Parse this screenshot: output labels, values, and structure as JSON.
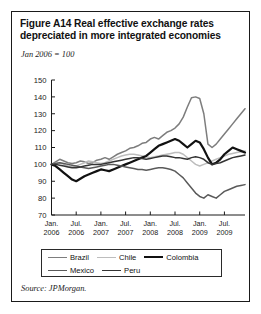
{
  "figure": {
    "title_line_1": "Figure A14  Real effective exchange rates",
    "title_line_2": "depreciated in more integrated economies",
    "index_note": "Jan 2006 = 100",
    "source": "Source: JPMorgan."
  },
  "legend": {
    "rows": [
      [
        {
          "label": "Brazil",
          "color": "#7d7d7d",
          "width": 1.5
        },
        {
          "label": "Chile",
          "color": "#bdbdbd",
          "width": 1.5
        },
        {
          "label": "Colombia",
          "color": "#111111",
          "width": 2.2
        }
      ],
      [
        {
          "label": "Mexico",
          "color": "#5a5a5a",
          "width": 1.5
        },
        {
          "label": "Peru",
          "color": "#343434",
          "width": 1.5
        }
      ]
    ]
  },
  "chart_data": {
    "type": "line",
    "title": "Figure A14  Real effective exchange rates depreciated in more integrated economies",
    "subtitle": "Jan 2006 = 100",
    "xlabel": "",
    "ylabel": "",
    "ylim": [
      70,
      150
    ],
    "yticks": [
      70,
      80,
      90,
      100,
      110,
      120,
      130,
      140,
      150
    ],
    "grid": false,
    "legend_position": "bottom",
    "xlim": [
      0,
      47
    ],
    "xticks": [
      0,
      6,
      12,
      18,
      24,
      30,
      36,
      42
    ],
    "xtick_labels": [
      {
        "month": "Jan.",
        "year": "2006"
      },
      {
        "month": "Jul.",
        "year": "2006"
      },
      {
        "month": "Jan.",
        "year": "2007"
      },
      {
        "month": "Jul.",
        "year": "2007"
      },
      {
        "month": "Jan.",
        "year": "2008"
      },
      {
        "month": "Jul.",
        "year": "2008"
      },
      {
        "month": "Jan.",
        "year": "2009"
      },
      {
        "month": "Jul.",
        "year": "2009"
      }
    ],
    "x": [
      0,
      1,
      2,
      3,
      4,
      5,
      6,
      7,
      8,
      9,
      10,
      11,
      12,
      13,
      14,
      15,
      16,
      17,
      18,
      19,
      20,
      21,
      22,
      23,
      24,
      25,
      26,
      27,
      28,
      29,
      30,
      31,
      32,
      33,
      34,
      35,
      36,
      37,
      38,
      39,
      40,
      41,
      42,
      43,
      44,
      45,
      46,
      47
    ],
    "series": [
      {
        "name": "Brazil",
        "color": "#7d7d7d",
        "width": 1.5,
        "values": [
          100,
          101.5,
          103,
          102,
          101,
          100.5,
          101,
          102,
          101.5,
          100.5,
          101,
          102.5,
          103,
          104,
          103,
          104.5,
          106,
          107,
          108,
          109.5,
          110,
          111,
          112.5,
          113,
          115,
          116,
          115,
          117,
          119,
          120,
          121.5,
          124,
          128,
          134,
          139.5,
          140,
          139,
          130,
          112,
          110,
          112,
          115,
          118,
          121,
          124,
          127,
          130,
          133
        ]
      },
      {
        "name": "Chile",
        "color": "#bdbdbd",
        "width": 1.5,
        "values": [
          100,
          100.5,
          101,
          100,
          99,
          98.5,
          99,
          100,
          101,
          102,
          101.5,
          101,
          100.5,
          101,
          102,
          103,
          104,
          105,
          105.5,
          106,
          106,
          105.5,
          105,
          104.5,
          104,
          104.5,
          105,
          105.5,
          106,
          106.5,
          107,
          107,
          106,
          104,
          102,
          100,
          99,
          100,
          101,
          102,
          103,
          104,
          105,
          106,
          106.5,
          107,
          107.5,
          108
        ]
      },
      {
        "name": "Colombia",
        "color": "#111111",
        "width": 2.2,
        "values": [
          100,
          99,
          97,
          95,
          93,
          91,
          90,
          91.5,
          93,
          94,
          95,
          96,
          97,
          96.5,
          96,
          97,
          98,
          99,
          100,
          101,
          102,
          103,
          104,
          105,
          107,
          109,
          111,
          112,
          113,
          114,
          115,
          114,
          112,
          110,
          112,
          114,
          113,
          109,
          104,
          100,
          101,
          103,
          106,
          108,
          110,
          109,
          108,
          107
        ]
      },
      {
        "name": "Mexico",
        "color": "#5a5a5a",
        "width": 1.5,
        "values": [
          100,
          100.5,
          101,
          100.5,
          100,
          99.5,
          99,
          98.5,
          98,
          97.5,
          98,
          98.5,
          99,
          99.5,
          100,
          100,
          99.5,
          99,
          98.5,
          98,
          97.5,
          97,
          97,
          96.5,
          97,
          97.5,
          98,
          98,
          97.5,
          97,
          96,
          94,
          92,
          89,
          86,
          83,
          81,
          80,
          82,
          81,
          80,
          82,
          84,
          85,
          86,
          87,
          87.5,
          88
        ]
      },
      {
        "name": "Peru",
        "color": "#343434",
        "width": 1.5,
        "values": [
          100,
          100,
          99.5,
          99,
          98.5,
          98,
          98,
          98.5,
          99,
          99.5,
          100,
          100,
          100,
          100.5,
          101,
          101.5,
          102,
          102.5,
          103,
          103.5,
          104,
          104,
          103.5,
          103,
          103.5,
          104,
          104.5,
          105,
          105,
          104.5,
          104,
          104,
          103.5,
          103,
          104,
          104.5,
          104,
          103,
          101,
          100,
          100.5,
          101,
          102,
          103,
          104,
          104.5,
          105,
          105.5
        ]
      }
    ]
  }
}
